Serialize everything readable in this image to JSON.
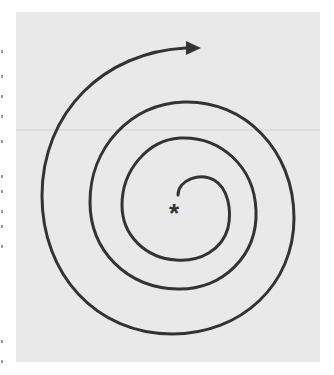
{
  "figure": {
    "type": "spiral-diagram",
    "center_marker": "*",
    "direction": "outward-clockwise",
    "arrow": "arrowhead-right-icon",
    "colors": {
      "background": "#e9e9e9",
      "stroke": "#333333"
    }
  }
}
